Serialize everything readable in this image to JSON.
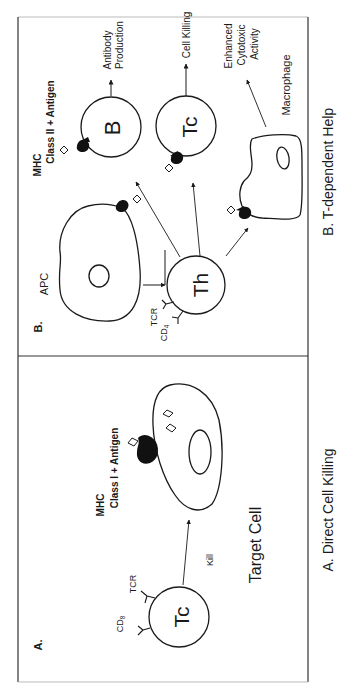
{
  "figure": {
    "orientation": "rotated 90 degrees counter-clockwise",
    "panel_a": {
      "label": "A.",
      "caption": "A. Direct Cell Killing",
      "effector_cell": "Tc",
      "receptor_labels": {
        "tcr": "TCR",
        "coreceptor": "CD",
        "coreceptor_sub": "8"
      },
      "action_label": "Kill",
      "target_label": "Target Cell",
      "mhc_label_line1": "MHC",
      "mhc_label_line2": "Class I  +  Antigen"
    },
    "panel_b": {
      "label": "B.",
      "caption": "B. T-dependent Help",
      "apc_label": "APC",
      "helper_cell": "Th",
      "receptor_labels": {
        "tcr": "TCR",
        "coreceptor": "CD",
        "coreceptor_sub": "4"
      },
      "mhc_label_line1": "MHC",
      "mhc_label_line2": "Class II  +  Antigen",
      "b_cell": "B",
      "b_outcome_line1": "Antibody",
      "b_outcome_line2": "Production",
      "tc_cell": "Tc",
      "tc_outcome": "Cell Killing",
      "macrophage_label": "Macrophage",
      "macrophage_outcome_line1": "Enhanced",
      "macrophage_outcome_line2": "Cytotoxic",
      "macrophage_outcome_line3": "Activity"
    }
  }
}
